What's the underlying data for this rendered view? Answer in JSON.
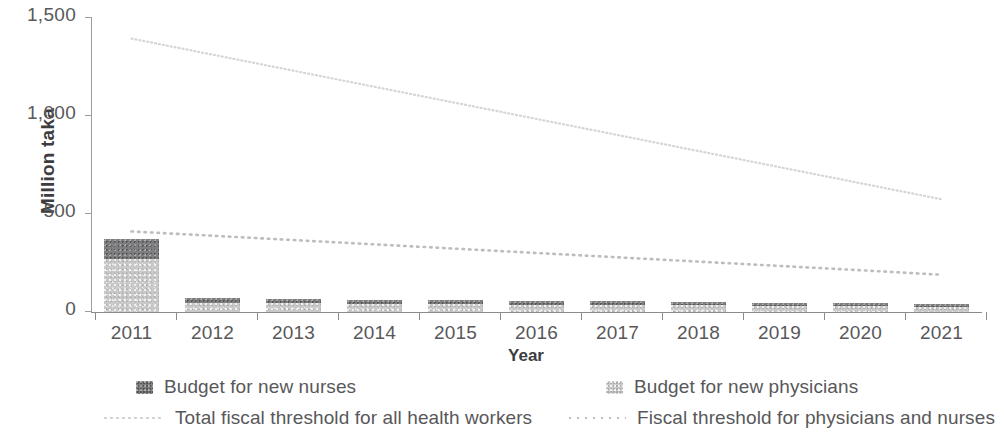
{
  "axes": {
    "y_title": "Million taka",
    "x_title": "Year",
    "y_ticks": [
      "0",
      "500",
      "1,000",
      "1,500"
    ]
  },
  "legend": {
    "items": [
      {
        "id": "budget-new-nurses",
        "label": "Budget for new nurses",
        "marker": "swatch-dark",
        "color": "#7e7e80"
      },
      {
        "id": "budget-new-physicians",
        "label": "Budget for new physicians",
        "marker": "swatch-light",
        "color": "#cdcdcd"
      },
      {
        "id": "total-fiscal-threshold",
        "label": "Total fiscal threshold for all health workers",
        "marker": "dotted-line-light",
        "color": "#d5d5d5"
      },
      {
        "id": "fiscal-threshold-physicians-nurses",
        "label": "Fiscal threshold for physicians and nurses",
        "marker": "dotted-line",
        "color": "#bdbdbd"
      }
    ]
  },
  "chart_data": {
    "type": "bar",
    "title": "",
    "subtitle": "",
    "xlabel": "Year",
    "ylabel": "Million taka",
    "ylim": [
      0,
      1500
    ],
    "yticks": [
      0,
      500,
      1000,
      1500
    ],
    "grid": false,
    "stacked": true,
    "legend_position": "bottom",
    "categories": [
      "2011",
      "2012",
      "2013",
      "2014",
      "2015",
      "2016",
      "2017",
      "2018",
      "2019",
      "2020",
      "2021"
    ],
    "series": [
      {
        "name": "Budget for new physicians",
        "type": "bar",
        "color": "#c9c9c9",
        "values": [
          270,
          48,
          44,
          42,
          40,
          38,
          36,
          34,
          32,
          30,
          28
        ]
      },
      {
        "name": "Budget for new nurses",
        "type": "bar",
        "color": "#7e7e80",
        "values": [
          105,
          24,
          22,
          21,
          20,
          19,
          18,
          17,
          16,
          15,
          15
        ]
      },
      {
        "name": "Total fiscal threshold for all health workers",
        "type": "line",
        "style": "dotted",
        "color": "#d5d5d5",
        "values": [
          1390,
          1308,
          1226,
          1144,
          1062,
          980,
          898,
          816,
          734,
          652,
          570
        ]
      },
      {
        "name": "Fiscal threshold for physicians and nurses",
        "type": "line",
        "style": "dotted",
        "color": "#bdbdbd",
        "values": [
          406,
          384,
          362,
          340,
          318,
          296,
          274,
          252,
          230,
          208,
          185
        ]
      }
    ],
    "stacked_totals": [
      375,
      72,
      66,
      63,
      60,
      57,
      54,
      51,
      48,
      45,
      43
    ]
  }
}
